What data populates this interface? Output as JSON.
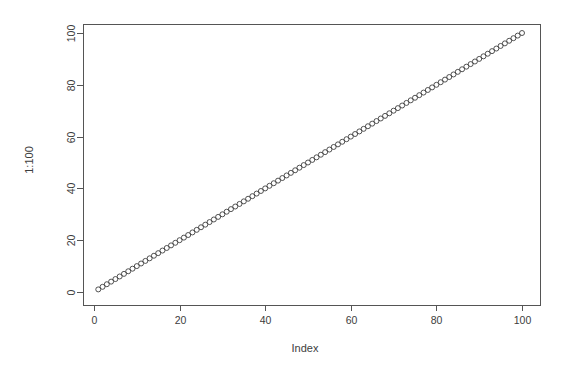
{
  "plot": {
    "window_title": "R Graphics: Device 2 (ACTIVE)",
    "background_color": "#ffffff",
    "frame_color": "#555555",
    "point_color": "#404040",
    "text_color": "#3d3d3d"
  },
  "chart_data": {
    "type": "scatter",
    "title": "",
    "subtitle": "",
    "xlabel": "Index",
    "ylabel": "1:100",
    "xlim": [
      0,
      100
    ],
    "ylim": [
      0,
      100
    ],
    "xticks": [
      0,
      20,
      40,
      60,
      80,
      100
    ],
    "yticks": [
      0,
      20,
      40,
      60,
      80,
      100
    ],
    "xtick_labels": [
      "0",
      "20",
      "40",
      "60",
      "80",
      "100"
    ],
    "ytick_labels": [
      "0",
      "20",
      "40",
      "60",
      "80",
      "100"
    ],
    "grid": false,
    "legend": false,
    "legend_position": "none",
    "marker": "open-circle",
    "marker_size": 2.5,
    "series": [
      {
        "name": "1:100",
        "x": [
          1,
          2,
          3,
          4,
          5,
          6,
          7,
          8,
          9,
          10,
          11,
          12,
          13,
          14,
          15,
          16,
          17,
          18,
          19,
          20,
          21,
          22,
          23,
          24,
          25,
          26,
          27,
          28,
          29,
          30,
          31,
          32,
          33,
          34,
          35,
          36,
          37,
          38,
          39,
          40,
          41,
          42,
          43,
          44,
          45,
          46,
          47,
          48,
          49,
          50,
          51,
          52,
          53,
          54,
          55,
          56,
          57,
          58,
          59,
          60,
          61,
          62,
          63,
          64,
          65,
          66,
          67,
          68,
          69,
          70,
          71,
          72,
          73,
          74,
          75,
          76,
          77,
          78,
          79,
          80,
          81,
          82,
          83,
          84,
          85,
          86,
          87,
          88,
          89,
          90,
          91,
          92,
          93,
          94,
          95,
          96,
          97,
          98,
          99,
          100
        ],
        "y": [
          1,
          2,
          3,
          4,
          5,
          6,
          7,
          8,
          9,
          10,
          11,
          12,
          13,
          14,
          15,
          16,
          17,
          18,
          19,
          20,
          21,
          22,
          23,
          24,
          25,
          26,
          27,
          28,
          29,
          30,
          31,
          32,
          33,
          34,
          35,
          36,
          37,
          38,
          39,
          40,
          41,
          42,
          43,
          44,
          45,
          46,
          47,
          48,
          49,
          50,
          51,
          52,
          53,
          54,
          55,
          56,
          57,
          58,
          59,
          60,
          61,
          62,
          63,
          64,
          65,
          66,
          67,
          68,
          69,
          70,
          71,
          72,
          73,
          74,
          75,
          76,
          77,
          78,
          79,
          80,
          81,
          82,
          83,
          84,
          85,
          86,
          87,
          88,
          89,
          90,
          91,
          92,
          93,
          94,
          95,
          96,
          97,
          98,
          99,
          100
        ]
      }
    ]
  },
  "geometry": {
    "plot_left": 83,
    "plot_right": 540,
    "plot_top": 24,
    "plot_bottom": 305,
    "x_data_min_px": 94,
    "x_data_max_px": 522,
    "y_data_min_px": 292,
    "y_data_max_px": 33,
    "tick_length": 6,
    "xlabel_x": 305,
    "xlabel_y": 352,
    "ylabel_x": 33,
    "ylabel_y": 160
  }
}
